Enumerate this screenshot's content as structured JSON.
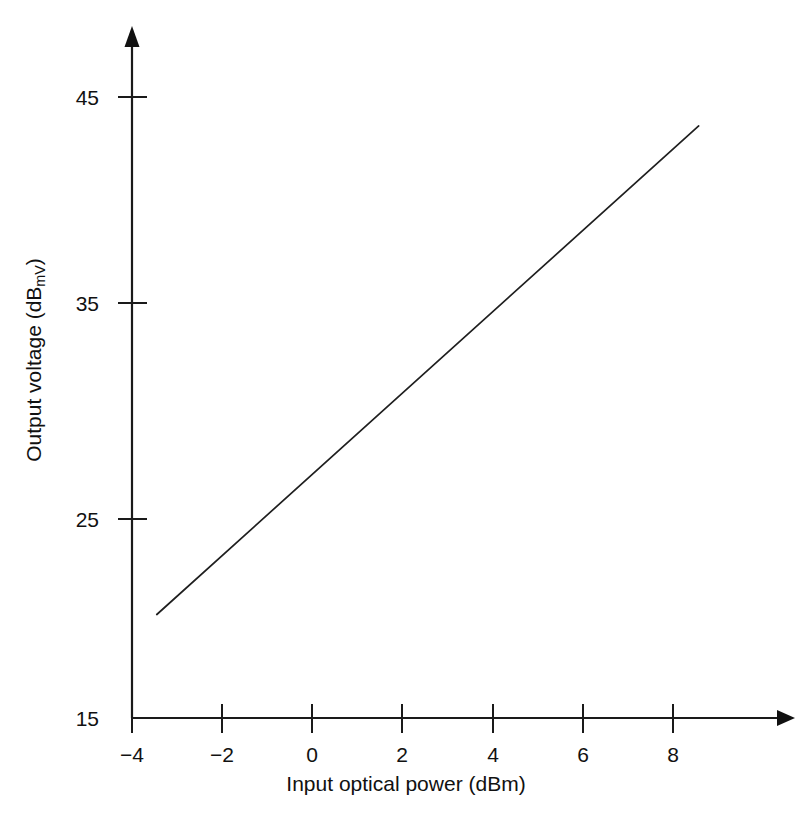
{
  "figure": {
    "background_color": "#ffffff",
    "line_color": "#1f1f1f",
    "axis_color": "#1a1a1a"
  },
  "axes": {
    "x": {
      "title_prefix": "Input optical power (dB",
      "title_sub": "",
      "title_suffix": "m)",
      "title_full": "Input optical power (dBm)",
      "ticks": [
        "−4",
        "−2",
        "0",
        "2",
        "4",
        "6",
        "8"
      ],
      "tick_values": [
        -4,
        -2,
        0,
        2,
        4,
        6,
        8
      ],
      "range": [
        -4,
        10.5
      ]
    },
    "y": {
      "title_prefix": "Output voltage (dB",
      "title_sub": "mV",
      "title_suffix": ")",
      "title_full": "Output voltage (dBmV)",
      "ticks": [
        "45",
        "35",
        "25",
        "15"
      ],
      "tick_values": [
        45,
        35,
        25,
        15
      ],
      "range": [
        15,
        48
      ]
    }
  },
  "chart_data": {
    "type": "line",
    "title": "",
    "subtitle": "",
    "xlabel": "Input optical power (dBm)",
    "ylabel": "Output voltage (dBmV)",
    "xlim": [
      -4,
      10.5
    ],
    "ylim": [
      15,
      48
    ],
    "xticks": [
      -4,
      -2,
      0,
      2,
      4,
      6,
      8
    ],
    "yticks": [
      45,
      35,
      25,
      15
    ],
    "grid": false,
    "legend": false,
    "legend_position": "none",
    "annotations": [],
    "series": [
      {
        "name": "Output voltage response",
        "x": [
          -3.45,
          8.57
        ],
        "y": [
          20.0,
          43.6
        ],
        "slope_db_per_dbm": 1.96,
        "points": [
          {
            "x": -3.45,
            "y": 20.0
          },
          {
            "x": -2.0,
            "y": 22.8
          },
          {
            "x": 0.0,
            "y": 26.8
          },
          {
            "x": 2.0,
            "y": 30.7
          },
          {
            "x": 4.0,
            "y": 34.6
          },
          {
            "x": 6.0,
            "y": 38.5
          },
          {
            "x": 8.0,
            "y": 42.5
          },
          {
            "x": 8.57,
            "y": 43.6
          }
        ]
      }
    ]
  }
}
